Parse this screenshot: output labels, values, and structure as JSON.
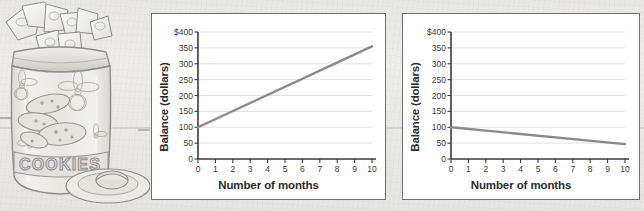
{
  "illustration": {
    "name": "cookie-jar-with-money-sketch",
    "description": "Pencil sketch of a cookie jar filled with dollar bills, with a plate and cookie",
    "jar_label": "COOKIES"
  },
  "charts": [
    {
      "id": "chart-left",
      "name": "savings-growth-chart",
      "chart_data": {
        "type": "line",
        "title": "",
        "xlabel": "Number of months",
        "ylabel": "Balance (dollars)",
        "xlim": [
          0,
          10
        ],
        "ylim": [
          0,
          400
        ],
        "xticks": [
          "0",
          "1",
          "2",
          "3",
          "4",
          "5",
          "6",
          "7",
          "8",
          "9",
          "10"
        ],
        "yticks": [
          "0",
          "50",
          "100",
          "150",
          "200",
          "250",
          "300",
          "350",
          "$400"
        ],
        "ytick_values": [
          0,
          50,
          100,
          150,
          200,
          250,
          300,
          350,
          400
        ],
        "grid": "horizontal",
        "legend": "none",
        "series": [
          {
            "name": "Balance",
            "x": [
              0,
              10
            ],
            "values": [
              100,
              355
            ],
            "color": "#8a8a8a"
          }
        ]
      }
    },
    {
      "id": "chart-right",
      "name": "savings-decline-chart",
      "chart_data": {
        "type": "line",
        "title": "",
        "xlabel": "Number of months",
        "ylabel": "Balance (dollars)",
        "xlim": [
          0,
          10
        ],
        "ylim": [
          0,
          400
        ],
        "xticks": [
          "0",
          "1",
          "2",
          "3",
          "4",
          "5",
          "6",
          "7",
          "8",
          "9",
          "10"
        ],
        "yticks": [
          "0",
          "50",
          "100",
          "150",
          "200",
          "250",
          "300",
          "350",
          "$400"
        ],
        "ytick_values": [
          0,
          50,
          100,
          150,
          200,
          250,
          300,
          350,
          400
        ],
        "grid": "horizontal",
        "legend": "none",
        "series": [
          {
            "name": "Balance",
            "x": [
              0,
              10
            ],
            "values": [
              100,
              47
            ],
            "color": "#8a8a8a"
          }
        ]
      }
    }
  ],
  "colors": {
    "page_background": "#eceae6",
    "panel_background": "#ffffff",
    "panel_border": "#6f6f6f",
    "axis": "#3a3a3a",
    "gridline": "#e2e2e2",
    "data_line": "#8a8a8a",
    "sketch": "#8d8d8d"
  }
}
